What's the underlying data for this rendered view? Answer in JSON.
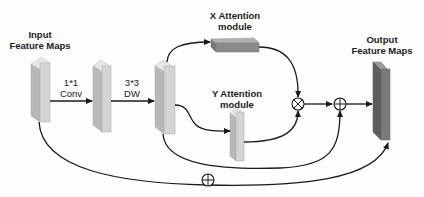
{
  "diagram": {
    "nodes": {
      "input": {
        "title_line1": "Input",
        "title_line2": "Feature Maps"
      },
      "conv1x1": {
        "op_line1": "1*1",
        "op_line2": "Conv"
      },
      "dw3x3": {
        "op_line1": "3*3",
        "op_line2": "DW"
      },
      "x_attention": {
        "title_line1": "X Attention",
        "title_line2": "module"
      },
      "y_attention": {
        "title_line1": "Y Attention",
        "title_line2": "module"
      },
      "output": {
        "title_line1": "Output",
        "title_line2": "Feature Maps"
      }
    },
    "operators": {
      "multiply": "⊗",
      "add_inner": "⊕",
      "add_residual": "⊕"
    },
    "colors": {
      "block_light_front": "#d4d4d4",
      "block_light_side": "#b8b8b8",
      "block_light_top": "#e6e6e6",
      "block_output_front": "#7a7a7a",
      "block_output_side": "#5e5e5e",
      "block_output_top": "#9a9a9a",
      "x_block_front": "#8a8a8a",
      "x_block_top": "#b0b0b0",
      "line": "#1a1a1a"
    }
  }
}
